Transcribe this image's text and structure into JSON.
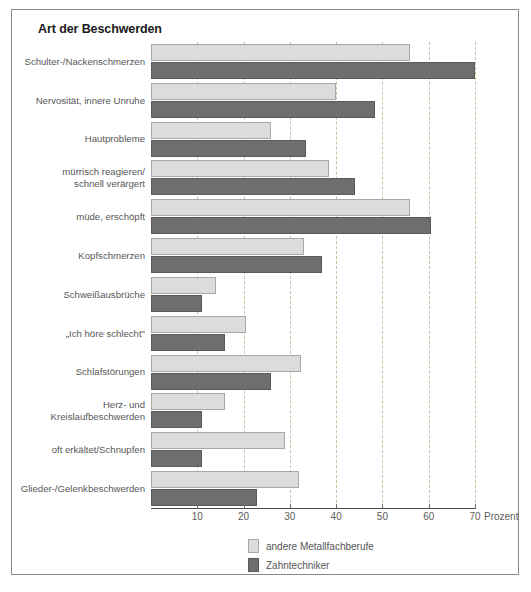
{
  "chart_data": {
    "type": "bar",
    "orientation": "horizontal",
    "title": "Art der Beschwerden",
    "xlabel": "Prozent",
    "ylabel": "",
    "xlim": [
      0,
      70
    ],
    "xticks": [
      10,
      20,
      30,
      40,
      50,
      60,
      70
    ],
    "xtick_labels": [
      "10",
      "20",
      "30",
      "40",
      "50",
      "60",
      "70"
    ],
    "grid": true,
    "grid_axis": "x",
    "legend_position": "bottom-center",
    "categories": [
      "Schulter-/Nackenschmerzen",
      "Nervosität, innere Unruhe",
      "Hautprobleme",
      "mürrisch reagieren/\nschnell verärgert",
      "müde, erschöpft",
      "Kopfschmerzen",
      "Schweißausbrüche",
      "„Ich höre schlecht\"",
      "Schlafstörungen",
      "Herz- und\nKreislaufbeschwerden",
      "oft erkältet/Schnupfen",
      "Glieder-/Gelenkbeschwerden"
    ],
    "series": [
      {
        "name": "andere Metallfachberufe",
        "color": "#dcdcdc",
        "values": [
          56,
          40,
          26,
          38.5,
          56,
          33,
          14,
          20.5,
          32.5,
          16,
          29,
          32
        ]
      },
      {
        "name": "Zahntechniker",
        "color": "#6e6e6e",
        "values": [
          70,
          48.5,
          33.5,
          44,
          60.5,
          37,
          11,
          16,
          26,
          11,
          11,
          23
        ]
      }
    ]
  },
  "legend": {
    "items": [
      {
        "label": "andere Metallfachberufe",
        "swatch": "light"
      },
      {
        "label": "Zahntechniker",
        "swatch": "dark"
      }
    ]
  },
  "axis": {
    "unit_label": "Prozent"
  },
  "colors": {
    "frame": "#8a8a8a",
    "grid": "#c9b79a",
    "axis": "#4d4d4d",
    "light_bar": "#dcdcdc",
    "dark_bar": "#6e6e6e",
    "text": "#575757",
    "title": "#1a1a1a"
  }
}
